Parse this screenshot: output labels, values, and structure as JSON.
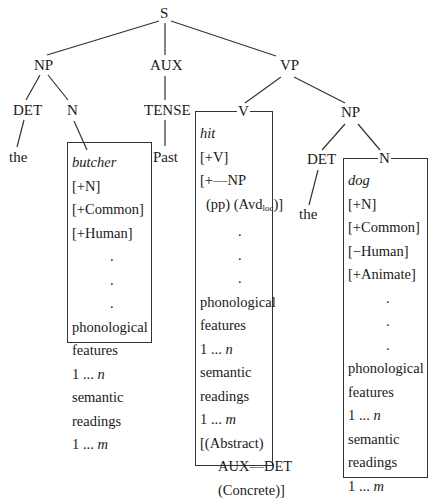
{
  "tree": {
    "root": "S",
    "level1": {
      "np": "NP",
      "aux": "AUX",
      "vp": "VP"
    },
    "subject": {
      "det": "DET",
      "n": "N",
      "det_word": "the"
    },
    "aux": {
      "tense": "TENSE",
      "tense_word": "Past"
    },
    "vp": {
      "v": "V",
      "np": "NP",
      "det": "DET",
      "det_word": "the",
      "n": "N"
    }
  },
  "lexical_entries": {
    "butcher": {
      "word": "butcher",
      "features": [
        "[+N]",
        "[+Common]",
        "[+Human]"
      ],
      "dots": [
        ".",
        ".",
        "."
      ],
      "phon": [
        "phonological",
        "features",
        "1 ... "
      ],
      "phon_var": "n",
      "sem": [
        "semantic",
        "readings",
        "1 ... "
      ],
      "sem_var": "m"
    },
    "hit": {
      "word": "hit",
      "features": [
        "[+V]",
        "[+—NP",
        "(pp) (Avd",
        "loc",
        ")]"
      ],
      "dots": [
        ".",
        ".",
        "."
      ],
      "phon": [
        "phonological",
        "features",
        "1 ... "
      ],
      "phon_var": "n",
      "sem": [
        "semantic",
        "readings",
        "1 ... "
      ],
      "sem_var": "m",
      "selection": [
        "[(Abstract)",
        "AUX—DET",
        "(Concrete)]"
      ]
    },
    "dog": {
      "word": "dog",
      "features": [
        "[+N]",
        "[+Common]",
        "[−Human]",
        "[+Animate]"
      ],
      "dots": [
        ".",
        ".",
        "."
      ],
      "phon": [
        "phonological",
        "features",
        "1 ... "
      ],
      "phon_var": "n",
      "sem": [
        "semantic",
        "readings",
        "1 ... "
      ],
      "sem_var": "m"
    }
  }
}
